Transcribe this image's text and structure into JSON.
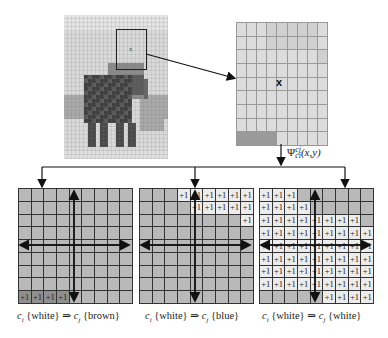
{
  "figure": {
    "source_image": {
      "description": "Pixelated image of an elephant with a selection window",
      "selection_marker": "x",
      "cols": 26,
      "rows": 36
    },
    "zoomed_window": {
      "center_marker": "x",
      "cols": 9,
      "rows": 9
    },
    "transform_label": {
      "symbol": "Ψ",
      "superscript": "cj",
      "subscript": "ci",
      "args": "(x,y)"
    },
    "panels": [
      {
        "caption_ci": "c",
        "caption_ci_sub": "i",
        "caption_from": "{white}",
        "caption_arrow": "⇒",
        "caption_cj": "c",
        "caption_cj_sub": "j",
        "caption_to": "{brown}",
        "caption_full": "ci {white} ⇒ cj {brown}",
        "cells_label": "+1",
        "cells": [
          "ddd.........",
          "",
          "",
          "",
          "",
          "",
          "",
          "",
          "PPPP"
        ]
      },
      {
        "caption_full": "ci {white} ⇒ cj {blue}",
        "caption_from": "{white}",
        "caption_to": "{blue}",
        "cells_label": "+1"
      },
      {
        "caption_full": "ci {white} ⇒ cj {white}",
        "caption_from": "{white}",
        "caption_to": "{white}",
        "cells_label": "+1"
      }
    ],
    "captions": [
      "{white}",
      "{brown}",
      "{white}",
      "{blue}",
      "{white}",
      "{white}"
    ],
    "plus_one": "+1",
    "colors": {
      "grid_gray": "#b9b9b9",
      "grid_white": "#ececec",
      "grid_dark": "#8f8f8f",
      "line": "#222222"
    }
  }
}
